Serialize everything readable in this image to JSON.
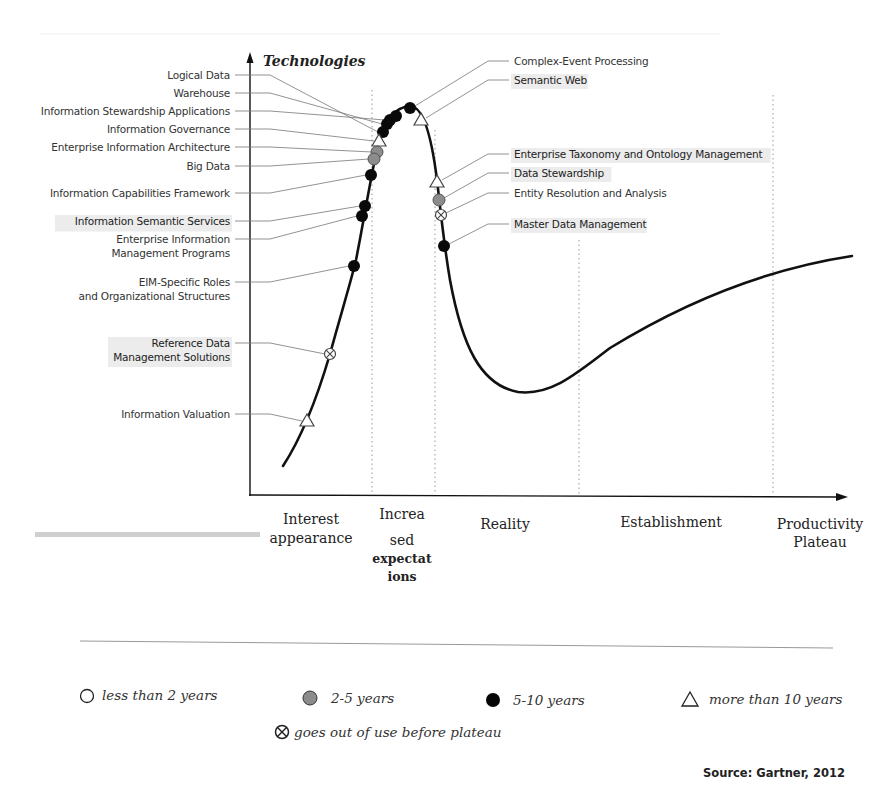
{
  "chart_data": {
    "type": "line",
    "ylabel": "Technologies",
    "xlabel": "",
    "phases": [
      "Interest appearance",
      "Increased expectations",
      "Reality",
      "Establishment",
      "Productivity Plateau"
    ],
    "phase_labels_rendered": {
      "interest": [
        "Interest",
        "appearance"
      ],
      "increased": [
        "Increa",
        "sed",
        "expectat",
        "ions"
      ],
      "reality": [
        "Reality"
      ],
      "establishment": [
        "Establishment"
      ],
      "plateau": [
        "Productivity",
        "Plateau"
      ]
    },
    "grid": false,
    "legend_position": "bottom",
    "legend": [
      {
        "key": "lt2",
        "symbol": "open-circle",
        "label": "less than 2 years"
      },
      {
        "key": "2to5",
        "symbol": "gray-circle",
        "label": "2-5 years"
      },
      {
        "key": "5to10",
        "symbol": "black-circle",
        "label": "5-10 years"
      },
      {
        "key": "gt10",
        "symbol": "triangle",
        "label": "more than 10 years"
      },
      {
        "key": "obsolete",
        "symbol": "crossed-circle",
        "label": "goes out of use before plateau"
      }
    ],
    "technologies": [
      {
        "name": "Logical Data",
        "side": "left",
        "category": "5-10 years",
        "phase": "Increased expectations"
      },
      {
        "name": "Warehouse",
        "side": "left",
        "category": "5-10 years",
        "phase": "Increased expectations"
      },
      {
        "name": "Information Stewardship Applications",
        "side": "left",
        "category": "5-10 years",
        "phase": "Increased expectations"
      },
      {
        "name": "Information Governance",
        "side": "left",
        "category": "more than 10 years",
        "phase": "Increased expectations"
      },
      {
        "name": "Enterprise Information Architecture",
        "side": "left",
        "category": "2-5 years",
        "phase": "Increased expectations"
      },
      {
        "name": "Big Data",
        "side": "left",
        "category": "2-5 years",
        "phase": "Increased expectations"
      },
      {
        "name": "Information Capabilities Framework",
        "side": "left",
        "category": "5-10 years",
        "phase": "Interest appearance"
      },
      {
        "name": "Information Semantic Services",
        "side": "left",
        "category": "5-10 years",
        "phase": "Interest appearance"
      },
      {
        "name": "Enterprise Information Management Programs",
        "side": "left",
        "category": "5-10 years",
        "phase": "Interest appearance"
      },
      {
        "name": "EIM-Specific Roles and Organizational Structures",
        "side": "left",
        "category": "5-10 years",
        "phase": "Interest appearance"
      },
      {
        "name": "Reference Data Management Solutions",
        "side": "left",
        "category": "goes out of use before plateau",
        "phase": "Interest appearance"
      },
      {
        "name": "Information Valuation",
        "side": "left",
        "category": "more than 10 years",
        "phase": "Interest appearance"
      },
      {
        "name": "Complex-Event Processing",
        "side": "right",
        "category": "5-10 years",
        "phase": "Increased expectations"
      },
      {
        "name": "Semantic Web",
        "side": "right",
        "category": "more than 10 years",
        "phase": "Increased expectations"
      },
      {
        "name": "Enterprise Taxonomy and Ontology Management",
        "side": "right",
        "category": "more than 10 years",
        "phase": "Reality"
      },
      {
        "name": "Data Stewardship",
        "side": "right",
        "category": "2-5 years",
        "phase": "Reality"
      },
      {
        "name": "Entity Resolution and Analysis",
        "side": "right",
        "category": "goes out of use before plateau",
        "phase": "Reality"
      },
      {
        "name": "Master Data Management",
        "side": "right",
        "category": "5-10 years",
        "phase": "Reality"
      }
    ],
    "source": "Source: Gartner, 2012"
  },
  "axis": {
    "y_title": "Technologies"
  },
  "left_labels": [
    {
      "lines": [
        "Logical Data"
      ],
      "highlight": false,
      "y": 79,
      "mx": 383,
      "my": 132,
      "sym": "black"
    },
    {
      "lines": [
        "Warehouse"
      ],
      "highlight": false,
      "y": 97,
      "mx": 387,
      "my": 124,
      "sym": "black"
    },
    {
      "lines": [
        "Information Stewardship Applications"
      ],
      "highlight": false,
      "y": 115,
      "mx": 390,
      "my": 120,
      "sym": "black"
    },
    {
      "lines": [
        "Information Governance"
      ],
      "highlight": false,
      "y": 133,
      "mx": 379,
      "my": 141,
      "sym": "triangle"
    },
    {
      "lines": [
        "Enterprise Information Architecture"
      ],
      "highlight": false,
      "y": 151,
      "mx": 377,
      "my": 152,
      "sym": "gray"
    },
    {
      "lines": [
        "Big Data"
      ],
      "highlight": false,
      "y": 170,
      "mx": 374,
      "my": 159,
      "sym": "gray"
    },
    {
      "lines": [
        "Information Capabilities Framework"
      ],
      "highlight": false,
      "y": 197,
      "mx": 371,
      "my": 175,
      "sym": "black"
    },
    {
      "lines": [
        "Information Semantic Services"
      ],
      "highlight": true,
      "y": 225,
      "mx": 365,
      "my": 206,
      "sym": "black"
    },
    {
      "lines": [
        "Enterprise Information",
        "Management Programs"
      ],
      "highlight": false,
      "y": 243,
      "mx": 362,
      "my": 216,
      "sym": "black"
    },
    {
      "lines": [
        "EIM-Specific Roles",
        "and Organizational Structures"
      ],
      "highlight": false,
      "y": 286,
      "mx": 354,
      "my": 266,
      "sym": "black"
    },
    {
      "lines": [
        "Reference Data",
        "Management Solutions"
      ],
      "highlight": true,
      "y": 347,
      "mx": 330,
      "my": 354,
      "sym": "crossed"
    },
    {
      "lines": [
        "Information Valuation"
      ],
      "highlight": false,
      "y": 418,
      "mx": 307,
      "my": 421,
      "sym": "triangle"
    }
  ],
  "right_labels": [
    {
      "lines": [
        "Complex-Event Processing"
      ],
      "highlight": false,
      "y": 65,
      "mx": 410,
      "my": 108,
      "sym": "black"
    },
    {
      "lines": [
        "Semantic Web"
      ],
      "highlight": true,
      "y": 84,
      "mx": 421,
      "my": 120,
      "sym": "triangle"
    },
    {
      "lines": [
        "Enterprise Taxonomy and Ontology Management"
      ],
      "highlight": true,
      "y": 158,
      "mx": 437,
      "my": 182,
      "sym": "triangle"
    },
    {
      "lines": [
        "Data Stewardship"
      ],
      "highlight": true,
      "y": 177,
      "mx": 439,
      "my": 200,
      "sym": "gray"
    },
    {
      "lines": [
        "Entity Resolution and Analysis"
      ],
      "highlight": false,
      "y": 197,
      "mx": 441,
      "my": 215,
      "sym": "crossed"
    },
    {
      "lines": [
        "Master Data Management"
      ],
      "highlight": true,
      "y": 228,
      "mx": 444,
      "my": 246,
      "sym": "black"
    }
  ],
  "extra_markers": [
    {
      "mx": 396,
      "my": 116,
      "sym": "black"
    }
  ],
  "legend": {
    "lt2": "less than 2 years",
    "2to5": "2-5 years",
    "5to10": "5-10 years",
    "gt10": "more than 10 years",
    "obsolete": "goes out of use before plateau"
  },
  "source": "Source: Gartner, 2012",
  "colors": {
    "curve": "#111111",
    "black_marker": "#0a0a0a",
    "gray_marker": "#8c8c8c",
    "leader": "#777777",
    "highlight": "#ececec"
  }
}
